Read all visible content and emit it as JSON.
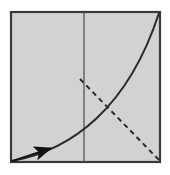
{
  "figure": {
    "canvas": {
      "width": 170,
      "height": 175,
      "background": "#ffffff"
    },
    "panel": {
      "name": "paper-square",
      "x": 11,
      "y": 12,
      "width": 149,
      "height": 150,
      "fill": "#d2d2d2",
      "stroke": "#3a3a3a",
      "stroke_width": 2.2
    },
    "center_line": {
      "name": "vertical-center-crease",
      "x1": 84,
      "y1": 12,
      "x2": 84,
      "y2": 162,
      "stroke": "#4a4a4a",
      "stroke_width": 1.2,
      "style": "solid"
    },
    "curve": {
      "name": "solid-curved-fold",
      "start": [
        12,
        161
      ],
      "control1": [
        72,
        150
      ],
      "control2": [
        128,
        108
      ],
      "end": [
        159,
        13
      ],
      "stroke": "#2a2a2a",
      "stroke_width": 2.0,
      "style": "solid",
      "fill": "none"
    },
    "dashed_line": {
      "name": "dashed-fold-line",
      "x1": 80,
      "y1": 79,
      "x2": 160,
      "y2": 161,
      "stroke": "#2a2a2a",
      "stroke_width": 2.0,
      "style": "dashed",
      "dash_pattern": "5 4"
    },
    "arrow": {
      "name": "fold-direction-arrow",
      "tail": [
        12,
        161
      ],
      "head": [
        61,
        145
      ],
      "stroke": "#111111",
      "stroke_width": 1.8,
      "head_length": 11,
      "head_width": 7,
      "fill": "#111111"
    }
  }
}
